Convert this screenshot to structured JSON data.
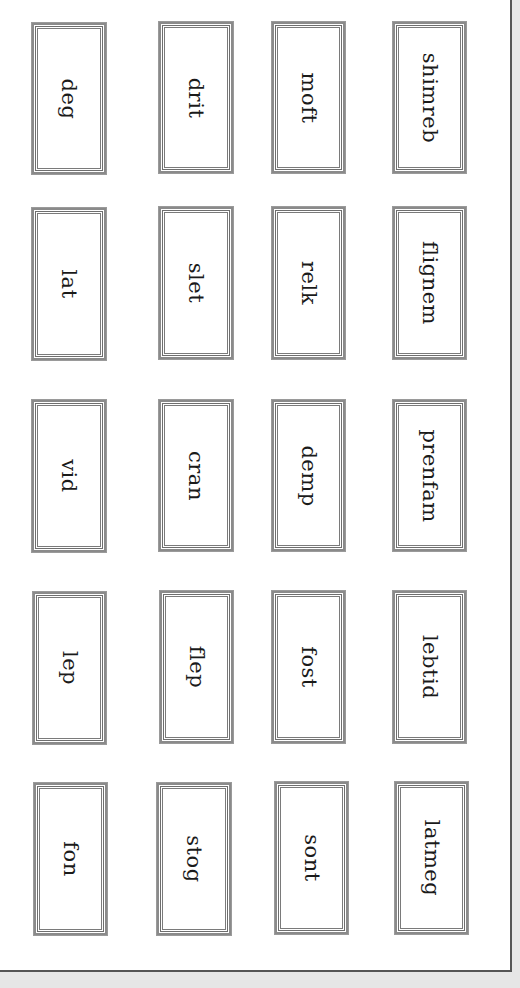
{
  "worksheet": {
    "orientation": "rotated-90",
    "cards": [
      {
        "word": "deg",
        "col": 0,
        "row": 0
      },
      {
        "word": "drit",
        "col": 1,
        "row": 0
      },
      {
        "word": "moft",
        "col": 2,
        "row": 0
      },
      {
        "word": "shimreb",
        "col": 3,
        "row": 0
      },
      {
        "word": "lat",
        "col": 0,
        "row": 1
      },
      {
        "word": "slet",
        "col": 1,
        "row": 1
      },
      {
        "word": "relk",
        "col": 2,
        "row": 1
      },
      {
        "word": "flignem",
        "col": 3,
        "row": 1
      },
      {
        "word": "vid",
        "col": 0,
        "row": 2
      },
      {
        "word": "cran",
        "col": 1,
        "row": 2
      },
      {
        "word": "demp",
        "col": 2,
        "row": 2
      },
      {
        "word": "prenfam",
        "col": 3,
        "row": 2
      },
      {
        "word": "lep",
        "col": 0,
        "row": 3
      },
      {
        "word": "flep",
        "col": 1,
        "row": 3
      },
      {
        "word": "fost",
        "col": 2,
        "row": 3
      },
      {
        "word": "lebtid",
        "col": 3,
        "row": 3
      },
      {
        "word": "fon",
        "col": 0,
        "row": 4
      },
      {
        "word": "stog",
        "col": 1,
        "row": 4
      },
      {
        "word": "sont",
        "col": 2,
        "row": 4
      },
      {
        "word": "latmeg",
        "col": 3,
        "row": 4
      }
    ]
  },
  "colors": {
    "page_background": "#ffffff",
    "outer_background": "#e6e6e6",
    "card_border": "#8a8a8a",
    "text": "#1a1a1a"
  }
}
